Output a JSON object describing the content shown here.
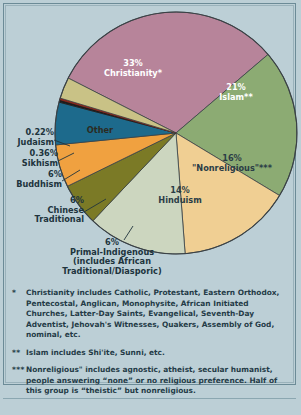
{
  "chart_data": {
    "type": "pie",
    "title": "",
    "legend_position": "callouts",
    "grid": false,
    "categories": [
      "Christianity*",
      "Islam**",
      "\"Nonreligious\"***",
      "Hinduism",
      "Primal-Indigenous (includes African Traditional/Diasporic)",
      "Chinese Traditional",
      "Buddhism",
      "Sikhism",
      "Judaism",
      "Other"
    ],
    "values": [
      33,
      21,
      16,
      14,
      6,
      6,
      6,
      0.36,
      0.22,
      3
    ],
    "value_labels": [
      "33%",
      "21%",
      "16%",
      "14%",
      "6%",
      "6%",
      "6%",
      "0.36%",
      "0.22%",
      ""
    ],
    "colors": [
      "#b7849a",
      "#8cab73",
      "#f0cf93",
      "#ccd6bf",
      "#7b7a26",
      "#f0a140",
      "#1d6a8c",
      "#1c1c1c",
      "#8e2418",
      "#c9c286"
    ],
    "xlabel": "",
    "ylabel": ""
  },
  "inside_labels": [
    {
      "pct": "33%",
      "name": "Christianity*"
    },
    {
      "pct": "21%",
      "name": "Islam**"
    },
    {
      "pct": "16%",
      "name": "\"Nonreligious\"***"
    },
    {
      "pct": "14%",
      "name": "Hinduism"
    },
    {
      "name": "Other"
    }
  ],
  "callouts": {
    "judaism": "0.22%\nJudaism",
    "sikhism": "0.36%\nSikhism",
    "buddhism": "6%\nBuddhism",
    "chinese": "6%\nChinese\nTraditional",
    "primal": "6%\nPrimal-Indigenous\n(includes African\nTraditional/Diasporic)"
  },
  "footnotes": [
    {
      "mark": "*",
      "text": "Christianity includes Catholic, Protestant, Eastern Orthodox, Pentecostal, Anglican, Monophysite, African Initiated Churches, Latter-Day Saints, Evangelical, Seventh-Day Adventist, Jehovah's Witnesses, Quakers, Assembly of God, nominal, etc."
    },
    {
      "mark": "**",
      "text": "Islam includes Shi'ite, Sunni, etc."
    },
    {
      "mark": "***",
      "text": "Nonreligious\" includes agnostic, atheist, secular humanist, people answering “none” or no religious preference. Half of this group is “theistic” but nonreligious."
    }
  ]
}
